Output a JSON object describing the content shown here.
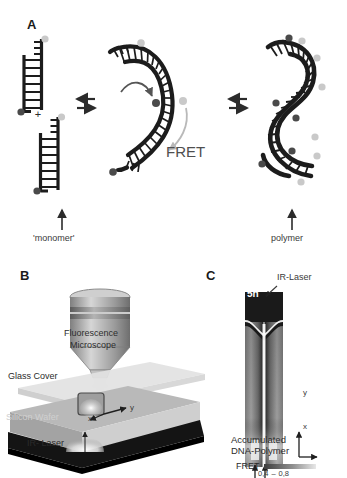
{
  "figure": {
    "panels": [
      {
        "letter": "A",
        "labels": {
          "monomer": "'monomer'",
          "plus": "+",
          "fret": "FRET",
          "polymer": "polymer"
        },
        "equilibrium_symbol": "⇌",
        "states": [
          "monomer",
          "dimer",
          "polymer"
        ]
      },
      {
        "letter": "B",
        "labels": {
          "microscope_line1": "Fluorescence",
          "microscope_line2": "Microscope",
          "glass_cover": "Glass Cover",
          "silicon_wafer": "Silicon Wafer",
          "ir_laser": "IR- Laser",
          "axis_x": "x",
          "axis_y": "y"
        }
      },
      {
        "letter": "C",
        "labels": {
          "ir_laser": "IR-Laser",
          "time": "5h",
          "axis_x": "x",
          "axis_y": "y",
          "accumulated_line1": "Accumulated",
          "accumulated_line2": "DNA-Polymer",
          "fret_legend": "FRET",
          "scale_min": "0,4",
          "scale_dash": "–",
          "scale_max": "0,8"
        }
      }
    ],
    "colors": {
      "ink": "#1c1c1c",
      "donor_dye": "#4a4a4a",
      "acceptor_dye": "#c9c9c9",
      "arrow": "#2b2b2b",
      "glass": "#d9d9d9",
      "wafer": "#b6b6b6",
      "wafer_dark": "#8f8f8f",
      "base_dark": "#111111",
      "chamber_bright": "#f2f2f2",
      "chamber_mid": "#8c8c8c",
      "chamber_dark": "#1f1f1f"
    }
  }
}
